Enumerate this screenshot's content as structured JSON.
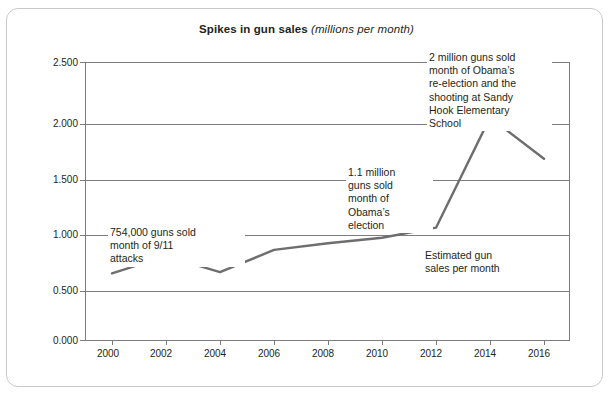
{
  "card": {
    "border_color": "#c9c9c9",
    "background": "#ffffff"
  },
  "title": {
    "main": "Spikes in gun sales ",
    "sub": "(millions per month)"
  },
  "chart_data": {
    "type": "line",
    "title": "Spikes in gun sales (millions per month)",
    "xlabel": "",
    "ylabel": "",
    "x": [
      2000,
      2002,
      2004,
      2006,
      2008,
      2010,
      2012,
      2014,
      2016
    ],
    "categories": [
      "2000",
      "2002",
      "2004",
      "2006",
      "2008",
      "2010",
      "2012",
      "2014",
      "2016"
    ],
    "series": [
      {
        "name": "Estimated gun sales per month",
        "color": "#6e6e6e",
        "values": [
          0.6,
          0.755,
          0.61,
          0.81,
          0.87,
          0.92,
          1.01,
          2.0,
          1.63
        ]
      }
    ],
    "xlim": [
      1999,
      2017
    ],
    "ylim": [
      0.0,
      2.5
    ],
    "ytick_values": [
      0.0,
      0.5,
      1.0,
      1.5,
      2.0,
      2.5
    ],
    "ytick_labels": [
      "0.000",
      "0.500",
      "1.000",
      "1.500",
      "2.000",
      "2.500"
    ],
    "xtick_labels": [
      "2000",
      "2002",
      "2004",
      "2006",
      "2008",
      "2010",
      "2012",
      "2014",
      "2016"
    ],
    "grid": "horizontal",
    "grid_color": "#7c7c7c",
    "legend": "none",
    "annotations": [
      {
        "id": "sep-11",
        "text": "754,000 guns sold\nmonth of 9/11\nattacks",
        "points_to": {
          "x": 2002,
          "y": 0.755
        }
      },
      {
        "id": "obama-election",
        "text": "1.1 million\nguns sold\nmonth of\nObama’s\nelection",
        "points_to": {
          "x": 2012,
          "y": 1.01
        }
      },
      {
        "id": "sandy-hook",
        "text": "2 million guns sold\nmonth of Obama’s\nre-election and the\nshooting at Sandy\nHook Elementary\nSchool",
        "points_to": {
          "x": 2014,
          "y": 2.0
        }
      },
      {
        "id": "series-label",
        "text": "Estimated gun\nsales per month",
        "points_to": {
          "x": 2013,
          "y": 1.2
        }
      }
    ]
  }
}
